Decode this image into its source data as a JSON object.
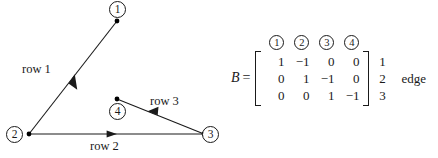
{
  "figure": {
    "graph": {
      "nodes": [
        {
          "id": "1",
          "label": "①",
          "plain": "1",
          "x": 117,
          "y": 21
        },
        {
          "id": "2",
          "label": "②",
          "plain": "2",
          "x": 29,
          "y": 134
        },
        {
          "id": "3",
          "label": "③",
          "plain": "3",
          "x": 204,
          "y": 134
        },
        {
          "id": "4",
          "label": "④",
          "plain": "4",
          "x": 117,
          "y": 99
        }
      ],
      "edges": [
        {
          "label": "row 1",
          "from": "1",
          "to": "2"
        },
        {
          "label": "row 2",
          "from": "2",
          "to": "3"
        },
        {
          "label": "row 3",
          "from": "3",
          "to": "4"
        }
      ],
      "line_color": "#1a1a1a",
      "node_dot_color": "#000000"
    },
    "matrix": {
      "name": "B",
      "equals": "=",
      "column_headers": [
        "①",
        "②",
        "③",
        "④"
      ],
      "column_headers_plain": [
        "1",
        "2",
        "3",
        "4"
      ],
      "rows": [
        [
          "1",
          "−1",
          "0",
          "0"
        ],
        [
          "0",
          "1",
          "−1",
          "0"
        ],
        [
          "0",
          "0",
          "1",
          "−1"
        ]
      ],
      "row_labels": [
        "1",
        "2",
        "3"
      ],
      "side_caption": "edge"
    }
  }
}
